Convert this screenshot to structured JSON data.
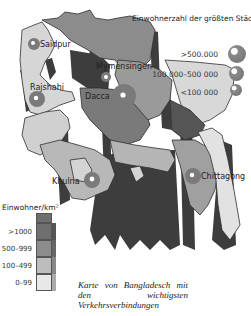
{
  "map": {
    "country": "Bangladesch",
    "palette": {
      "density_gt_1000": "#6f6f6f",
      "density_500_999": "#8c8c8c",
      "density_100_499": "#bdbdbd",
      "density_0_99": "#e8e8e8",
      "wall_dark": "#3d3d3d",
      "city_marker": "#7a7a7a"
    },
    "cities": [
      {
        "name": "Saidpur",
        "size_class": "<100 000"
      },
      {
        "name": "Rajshahi",
        "size_class": "100 000–500 000"
      },
      {
        "name": "Mymensingen",
        "size_class": "<100 000"
      },
      {
        "name": "Dacca",
        "size_class": ">500.000"
      },
      {
        "name": "Khulna",
        "size_class": ">500.000"
      },
      {
        "name": "Chittagong",
        "size_class": ">500.000"
      }
    ]
  },
  "legend_cities": {
    "title": "Einwohnerzahl der größten Städte",
    "items": [
      {
        "label": ">500.000"
      },
      {
        "label": "100 000–500 000"
      },
      {
        "label": "<100 000"
      }
    ]
  },
  "legend_density": {
    "title": "Einwohner/km²",
    "items": [
      {
        "label": ">1000",
        "color": "#6f6f6f"
      },
      {
        "label": "500–999",
        "color": "#8c8c8c"
      },
      {
        "label": "100–499",
        "color": "#bdbdbd"
      },
      {
        "label": "0–99",
        "color": "#e8e8e8"
      }
    ]
  },
  "caption": "Karte von Bangladesch mit den wichtigsten Verkehrsverbindungen"
}
